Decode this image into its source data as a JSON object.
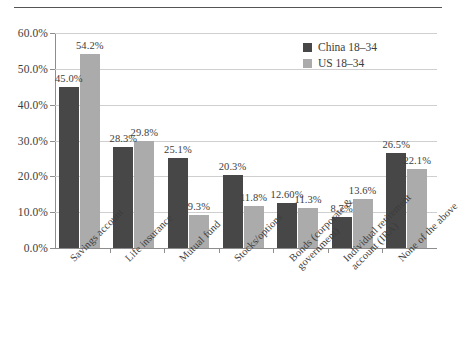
{
  "chart_data": {
    "type": "bar",
    "title": "",
    "xlabel": "",
    "ylabel": "",
    "ylim": [
      0,
      60
    ],
    "ytick_values": [
      0,
      10,
      20,
      30,
      40,
      50,
      60
    ],
    "ytick_labels": [
      "0.0%",
      "10.0%",
      "20.0%",
      "30.0%",
      "40.0%",
      "50.0%",
      "60.0%"
    ],
    "grid": true,
    "legend_position": "top-right",
    "categories": [
      "Savings account",
      "Life insurance",
      "Mutual fund",
      "Stocks/options",
      "Bonds (corporate & government)",
      "Individual retirement account (IRA)",
      "None of the above"
    ],
    "category_lines": [
      [
        "Savings account"
      ],
      [
        "Life insurance"
      ],
      [
        "Mutual fund"
      ],
      [
        "Stocks/options"
      ],
      [
        "Bonds (corporate &",
        "government)"
      ],
      [
        "Individual retirement",
        "account (IRA)"
      ],
      [
        "None of the above"
      ]
    ],
    "series": [
      {
        "name": "China 18–34",
        "color": "#474747",
        "values": [
          45.0,
          28.3,
          25.1,
          20.3,
          12.6,
          8.7,
          26.5
        ],
        "labels": [
          "45.0%",
          "28.3%",
          "25.1%",
          "20.3%",
          "12.60%",
          "8.7%",
          "26.5%"
        ]
      },
      {
        "name": "US 18–34",
        "color": "#ababab",
        "values": [
          54.2,
          29.8,
          9.3,
          11.8,
          11.3,
          13.6,
          22.1
        ],
        "labels": [
          "54.2%",
          "29.8%",
          "9.3%",
          "11.8%",
          "11.3%",
          "13.6%",
          "22.1%"
        ]
      }
    ]
  },
  "legend": {
    "items": [
      {
        "label": "China 18–34",
        "color": "#474747"
      },
      {
        "label": "US 18–34",
        "color": "#ababab"
      }
    ]
  }
}
